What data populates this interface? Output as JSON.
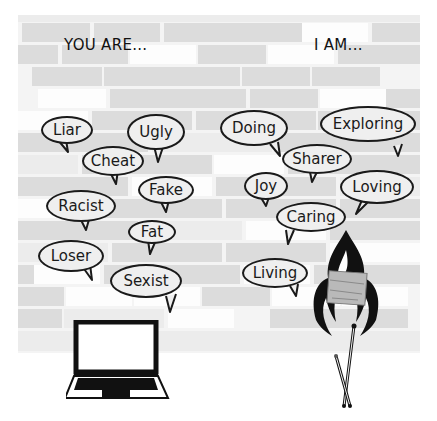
{
  "headings": {
    "left": "YOU ARE...",
    "right": "I AM..."
  },
  "left_bubbles": [
    {
      "label": "Liar"
    },
    {
      "label": "Ugly"
    },
    {
      "label": "Cheat"
    },
    {
      "label": "Fake"
    },
    {
      "label": "Racist"
    },
    {
      "label": "Fat"
    },
    {
      "label": "Loser"
    },
    {
      "label": "Sexist"
    }
  ],
  "right_bubbles": [
    {
      "label": "Doing"
    },
    {
      "label": "Exploring"
    },
    {
      "label": "Sharer"
    },
    {
      "label": "Joy"
    },
    {
      "label": "Loving"
    },
    {
      "label": "Caring"
    },
    {
      "label": "Living"
    }
  ],
  "illustrations": {
    "left": "laptop-icon",
    "right": "burning-paper-with-matches-icon"
  },
  "colors": {
    "ink": "#1a1a1a",
    "brick": "#dcdcdc",
    "background": "#ffffff"
  }
}
